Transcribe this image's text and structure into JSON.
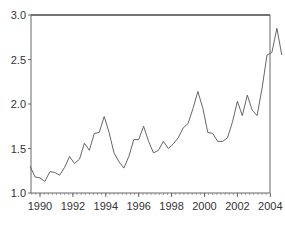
{
  "chart_data": {
    "type": "line",
    "title": "",
    "xlabel": "",
    "ylabel": "",
    "xlim": [
      1989.4,
      2004.8
    ],
    "ylim": [
      1.0,
      3.0
    ],
    "grid": false,
    "legend": null,
    "x_ticks": [
      1990,
      1992,
      1994,
      1996,
      1998,
      2000,
      2002,
      2004
    ],
    "x_tick_labels": [
      "1990",
      "1992",
      "1994",
      "1996",
      "1998",
      "2000",
      "2002",
      "2004"
    ],
    "y_ticks": [
      1.0,
      1.5,
      2.0,
      2.5,
      3.0
    ],
    "y_tick_labels": [
      "1.0",
      "1.5",
      "2.0",
      "2.5",
      "3.0"
    ],
    "line_color": "#555555",
    "series": [
      {
        "name": "series",
        "x": [
          1989.4,
          1989.7,
          1990.0,
          1990.3,
          1990.6,
          1990.9,
          1991.2,
          1991.5,
          1991.8,
          1992.1,
          1992.4,
          1992.7,
          1993.0,
          1993.3,
          1993.6,
          1993.9,
          1994.2,
          1994.5,
          1994.8,
          1995.1,
          1995.4,
          1995.7,
          1996.0,
          1996.3,
          1996.6,
          1996.9,
          1997.2,
          1997.5,
          1997.8,
          1998.1,
          1998.4,
          1998.7,
          1999.0,
          1999.3,
          1999.6,
          1999.9,
          2000.2,
          2000.5,
          2000.8,
          2001.1,
          2001.4,
          2001.7,
          2002.0,
          2002.3,
          2002.6,
          2002.9,
          2003.2,
          2003.5,
          2003.8,
          2004.1,
          2004.4,
          2004.7
        ],
        "values": [
          1.3,
          1.18,
          1.17,
          1.13,
          1.24,
          1.23,
          1.2,
          1.29,
          1.41,
          1.33,
          1.38,
          1.56,
          1.48,
          1.67,
          1.68,
          1.86,
          1.68,
          1.45,
          1.35,
          1.28,
          1.41,
          1.6,
          1.6,
          1.75,
          1.58,
          1.45,
          1.48,
          1.58,
          1.5,
          1.55,
          1.62,
          1.73,
          1.78,
          1.95,
          2.14,
          1.95,
          1.68,
          1.67,
          1.58,
          1.58,
          1.62,
          1.8,
          2.03,
          1.87,
          2.1,
          1.93,
          1.87,
          2.18,
          2.55,
          2.58,
          2.85,
          2.55
        ]
      }
    ]
  }
}
